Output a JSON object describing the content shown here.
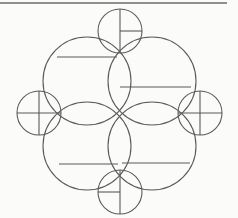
{
  "page": {
    "background_color": "#fbfbfa",
    "width": 238,
    "height": 218
  },
  "header_rule": {
    "name": "top-border-rule",
    "x1": 0,
    "y1": 3,
    "x2": 227,
    "y2": 3,
    "color": "#6d6d6d",
    "thickness": 1.6
  },
  "style": {
    "stroke_color": "#5a5a5a",
    "stroke_color_light": "#7e7e7e",
    "stroke_width": 1.1,
    "fill": "none"
  },
  "chart_data": {
    "type": "diagram",
    "units": "pixels",
    "center": {
      "x": 119,
      "y": 113
    },
    "large_circles": [
      {
        "id": "large-top-left",
        "label": "Top-left large circle",
        "cx": 87,
        "cy": 81,
        "r": 44,
        "chord": {
          "y": 57,
          "x1": 57,
          "x2": 117,
          "position": "upper"
        }
      },
      {
        "id": "large-top-right",
        "label": "Top-right large circle",
        "cx": 152,
        "cy": 81,
        "r": 44,
        "chord": {
          "y": 87,
          "x1": 120,
          "x2": 191,
          "position": "lower-center"
        }
      },
      {
        "id": "large-bottom-left",
        "label": "Bottom-left large circle",
        "cx": 87,
        "cy": 146,
        "r": 44,
        "chord": {
          "y": 164,
          "x1": 59,
          "x2": 118,
          "position": "lower"
        }
      },
      {
        "id": "large-bottom-right",
        "label": "Bottom-right large circle",
        "cx": 152,
        "cy": 146,
        "r": 44,
        "chord": {
          "y": 163,
          "x1": 122,
          "x2": 190,
          "position": "lower"
        }
      }
    ],
    "small_circles": [
      {
        "id": "small-north",
        "label": "North small circle",
        "cx": 120,
        "cy": 31,
        "r": 22,
        "marks": {
          "vertical": {
            "full": true
          },
          "horizontal": {
            "full": false,
            "side": "right"
          }
        }
      },
      {
        "id": "small-west",
        "label": "West small circle",
        "cx": 39,
        "cy": 113,
        "r": 22,
        "marks": {
          "vertical": {
            "full": true
          },
          "horizontal": {
            "full": true,
            "side": "both"
          }
        }
      },
      {
        "id": "small-east",
        "label": "East small circle",
        "cx": 200,
        "cy": 113,
        "r": 22,
        "marks": {
          "vertical": {
            "full": true
          },
          "horizontal": {
            "full": true,
            "side": "both"
          }
        }
      },
      {
        "id": "small-south",
        "label": "South small circle",
        "cx": 120,
        "cy": 192,
        "r": 22,
        "marks": {
          "vertical": {
            "full": true
          },
          "horizontal": {
            "full": false,
            "side": "left"
          }
        }
      }
    ],
    "counts": {
      "large_circle_count": 4,
      "small_circle_count": 8,
      "total_circle_count": 8,
      "chord_count": 4
    }
  }
}
